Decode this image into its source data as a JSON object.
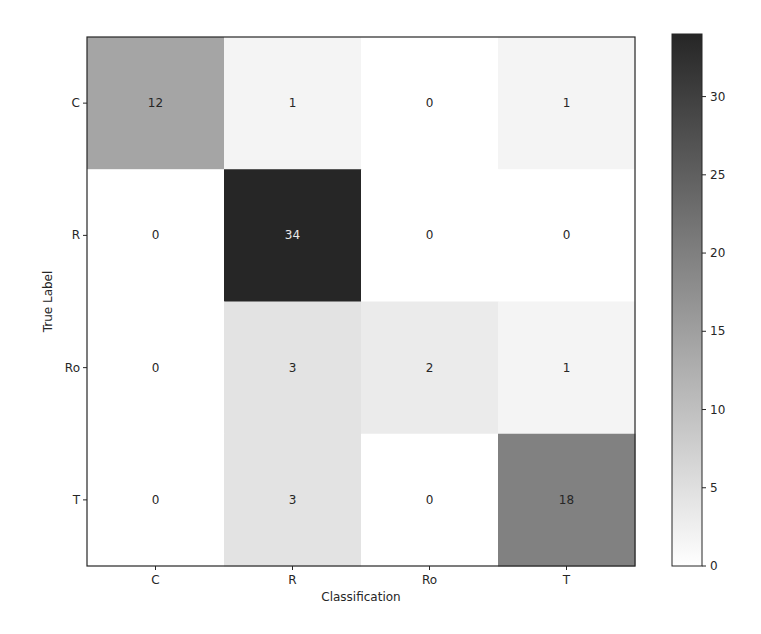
{
  "chart_data": {
    "type": "heatmap",
    "title": "",
    "xlabel": "Classification",
    "ylabel": "True Label",
    "x_categories": [
      "C",
      "R",
      "Ro",
      "T"
    ],
    "y_categories": [
      "C",
      "R",
      "Ro",
      "T"
    ],
    "values": [
      [
        12,
        1,
        0,
        1
      ],
      [
        0,
        34,
        0,
        0
      ],
      [
        0,
        3,
        2,
        1
      ],
      [
        0,
        3,
        0,
        18
      ]
    ],
    "colormap": "Greys",
    "colorbar": {
      "range": [
        0,
        34
      ],
      "ticks": [
        0,
        5,
        10,
        15,
        20,
        25,
        30
      ],
      "tick_labels": [
        "0",
        "5",
        "10",
        "15",
        "20",
        "25",
        "30"
      ],
      "low_color": "#ffffff",
      "high_color": "#262626"
    },
    "grid": false
  }
}
